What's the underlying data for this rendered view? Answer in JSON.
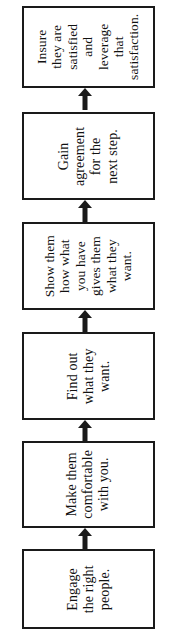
{
  "diagram": {
    "orientation": "vertical-bottom-to-top",
    "text_rotation_deg": -90,
    "colors": {
      "background": "#ffffff",
      "box_border": "#1a1a1a",
      "box_fill": "#ffffff",
      "text": "#111111",
      "arrow": "#1a1a1a"
    },
    "arrow_icon": "arrow-up-icon",
    "steps": [
      {
        "order": 6,
        "id": "insure-satisfied",
        "label": "Insure\nthey are\nsatisfied\nand\nleverage\nthat\nsatisfaction."
      },
      {
        "order": 5,
        "id": "gain-agreement",
        "label": "Gain\nagreement\nfor the\nnext step."
      },
      {
        "order": 4,
        "id": "show-them-how",
        "label": "Show them\nhow what\nyou have\ngives them\nwhat they\nwant."
      },
      {
        "order": 3,
        "id": "find-out-what-they-want",
        "label": "Find out\nwhat they\nwant."
      },
      {
        "order": 2,
        "id": "make-them-comfortable",
        "label": "Make them\ncomfortable\nwith you."
      },
      {
        "order": 1,
        "id": "engage-right-people",
        "label": "Engage\nthe right\npeople."
      }
    ],
    "connectors": [
      {
        "id": "arrow-5-to-6",
        "direction": "up"
      },
      {
        "id": "arrow-4-to-5",
        "direction": "up"
      },
      {
        "id": "arrow-3-to-4",
        "direction": "up"
      },
      {
        "id": "arrow-2-to-3",
        "direction": "up"
      },
      {
        "id": "arrow-1-to-2",
        "direction": "up"
      }
    ]
  }
}
